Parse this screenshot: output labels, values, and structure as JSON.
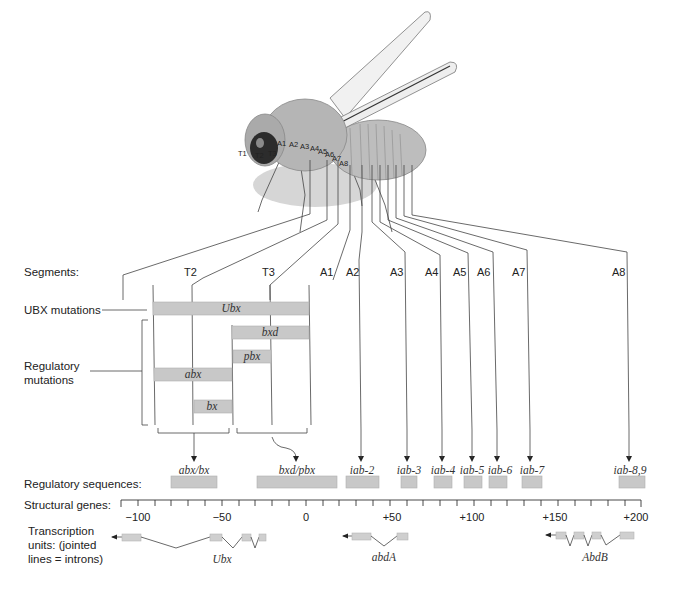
{
  "fly": {
    "segment_labels": [
      "T1",
      "T2",
      "T3",
      "A1",
      "A2",
      "A3",
      "A4",
      "A5",
      "A6",
      "A7",
      "A8"
    ]
  },
  "labels": {
    "segments": "Segments:",
    "ubx_mutations": "UBX mutations",
    "regulatory_mutations_line1": "Regulatory",
    "regulatory_mutations_line2": "mutations",
    "regulatory_sequences": "Regulatory sequences:",
    "structural_genes": "Structural genes:",
    "transcription_line1": "Transcription",
    "transcription_line2": "units:  (jointed",
    "transcription_line3": "lines = introns)"
  },
  "segments_row": [
    "T2",
    "T3",
    "A1",
    "A2",
    "A3",
    "A4",
    "A5",
    "A6",
    "A7",
    "A8"
  ],
  "mutations": {
    "ubx": "Ubx",
    "bxd": "bxd",
    "pbx": "pbx",
    "abx": "abx",
    "bx": "bx"
  },
  "regulatory_sequences": [
    "abx/bx",
    "bxd/pbx",
    "iab-2",
    "iab-3",
    "iab-4",
    "iab-5",
    "iab-6",
    "iab-7",
    "iab-8,9"
  ],
  "ruler": {
    "ticks": [
      "−100",
      "−50",
      "0",
      "+50",
      "+100",
      "+150",
      "+200"
    ],
    "range": [
      -110,
      200
    ],
    "minor_step": 10
  },
  "genes": [
    "Ubx",
    "abdA",
    "AbdB"
  ],
  "colors": {
    "bar_fill": "#c8c8c8",
    "line": "#333333",
    "fly_body": "#b9b9b9"
  }
}
